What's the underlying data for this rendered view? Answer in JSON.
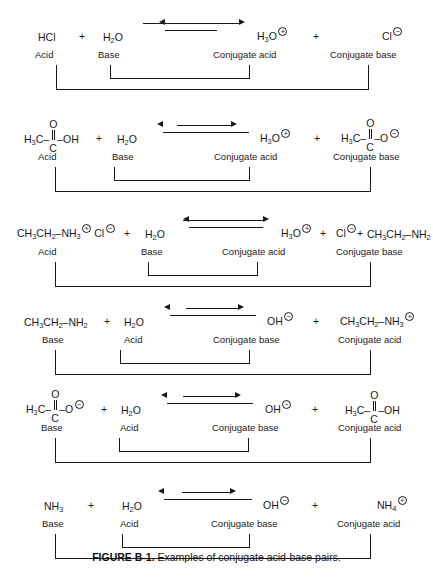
{
  "figure": {
    "caption_label": "FIGURE B-1.",
    "caption_text": " Examples of conjugate acid-base pairs."
  },
  "roles": {
    "acid": "Acid",
    "base": "Base",
    "conjugate_acid": "Conjugate acid",
    "conjugate_base": "Conjugate base"
  },
  "reactions": [
    {
      "id": "reaction-hcl-water",
      "reactant1": {
        "formula": "HCl",
        "role": "Acid"
      },
      "reactant2": {
        "formula": "H",
        "sub": "2",
        "formula2": "O",
        "role": "Base"
      },
      "product1": {
        "formula": "H",
        "sub": "3",
        "formula2": "O",
        "charge": "+",
        "role": "Conjugate acid"
      },
      "product2": {
        "formula": "Cl",
        "charge": "−",
        "role": "Conjugate base"
      },
      "plus1": "+",
      "plus2": "+"
    },
    {
      "id": "reaction-acetic-acid-water",
      "reactant1": {
        "formula": "H",
        "sub": "3",
        "formula2": "C–",
        "carbonyl_o": "O",
        "carbonyl_c": "C",
        "tail": "–OH",
        "role": "Acid"
      },
      "reactant2": {
        "formula": "H",
        "sub": "2",
        "formula2": "O",
        "role": "Base"
      },
      "product1": {
        "formula": "H",
        "sub": "3",
        "formula2": "O",
        "charge": "+",
        "role": "Conjugate acid"
      },
      "product2": {
        "formula": "H",
        "sub": "3",
        "formula2": "C–",
        "carbonyl_o": "O",
        "carbonyl_c": "C",
        "tail": "–O",
        "charge": "−",
        "role": "Conjugate base"
      },
      "plus1": "+",
      "plus2": "+"
    },
    {
      "id": "reaction-ethylammonium-chloride-water",
      "reactant1": {
        "formula": "CH",
        "sub": "3",
        "formula2": "CH",
        "sub2": "2",
        "formula3": "–NH",
        "sub3": "3",
        "charge": "+",
        "counterion": "Cl",
        "counterion_charge": "−",
        "role": "Acid"
      },
      "reactant2": {
        "formula": "H",
        "sub": "2",
        "formula2": "O",
        "role": "Base"
      },
      "product1": {
        "formula": "H",
        "sub": "3",
        "formula2": "O",
        "charge": "+",
        "role": "Conjugate acid"
      },
      "product2": {
        "formula": "Cl",
        "charge": "−",
        "role": ""
      },
      "product3": {
        "formula": "CH",
        "sub": "3",
        "formula2": "CH",
        "sub2": "2",
        "formula3": "–NH",
        "sub3": "2",
        "role": "Conjugate base"
      },
      "plus1": "+",
      "plus2": "+",
      "plus3": "+"
    },
    {
      "id": "reaction-ethylamine-water",
      "reactant1": {
        "formula": "CH",
        "sub": "3",
        "formula2": "CH",
        "sub2": "2",
        "formula3": "–NH",
        "sub3": "2",
        "role": "Base"
      },
      "reactant2": {
        "formula": "H",
        "sub": "2",
        "formula2": "O",
        "role": "Acid"
      },
      "product1": {
        "formula": "OH",
        "charge": "−",
        "role": "Conjugate base"
      },
      "product2": {
        "formula": "CH",
        "sub": "3",
        "formula2": "CH",
        "sub2": "2",
        "formula3": "–NH",
        "sub3": "3",
        "charge": "+",
        "role": "Conjugate acid"
      },
      "plus1": "+",
      "plus2": "+"
    },
    {
      "id": "reaction-acetate-water",
      "reactant1": {
        "formula": "H",
        "sub": "3",
        "formula2": "C–",
        "carbonyl_o": "O",
        "carbonyl_c": "C",
        "tail": "–O",
        "charge": "−",
        "role": "Base"
      },
      "reactant2": {
        "formula": "H",
        "sub": "2",
        "formula2": "O",
        "role": "Acid"
      },
      "product1": {
        "formula": "OH",
        "charge": "−",
        "role": "Conjugate base"
      },
      "product2": {
        "formula": "H",
        "sub": "3",
        "formula2": "C–",
        "carbonyl_o": "O",
        "carbonyl_c": "C",
        "tail": "–OH",
        "role": "Conjugate acid"
      },
      "plus1": "+",
      "plus2": "+"
    },
    {
      "id": "reaction-ammonia-water",
      "reactant1": {
        "formula": "NH",
        "sub": "3",
        "role": "Base"
      },
      "reactant2": {
        "formula": "H",
        "sub": "2",
        "formula2": "O",
        "role": "Acid"
      },
      "product1": {
        "formula": "OH",
        "charge": "−",
        "role": "Conjugate base"
      },
      "product2": {
        "formula": "NH",
        "sub": "4",
        "charge": "+",
        "role": "Conjugate acid"
      },
      "plus1": "+",
      "plus2": "+"
    }
  ],
  "colors": {
    "ink": "#1a1a1a",
    "background": "#ffffff"
  }
}
